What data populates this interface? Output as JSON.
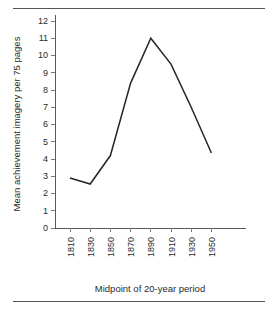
{
  "figure": {
    "top_rule": "",
    "bottom_rule": ""
  },
  "chart_data": {
    "type": "line",
    "title": "",
    "xlabel": "Midpoint of 20-year period",
    "ylabel": "Mean achievement imagery per 75 pages",
    "categories": [
      "1810",
      "1830",
      "1850",
      "1870",
      "1890",
      "1910",
      "1930",
      "1950"
    ],
    "x": [
      1810,
      1830,
      1850,
      1870,
      1890,
      1910,
      1930,
      1950
    ],
    "values": [
      2.9,
      2.55,
      4.2,
      8.4,
      11.0,
      9.5,
      7.0,
      4.35
    ],
    "series": [
      {
        "name": "Mean achievement imagery",
        "values": [
          2.9,
          2.55,
          4.2,
          8.4,
          11.0,
          9.5,
          7.0,
          4.35
        ]
      }
    ],
    "ylim": [
      0,
      12
    ],
    "xlim": [
      1800,
      1960
    ],
    "ytick_labels": [
      "0",
      "1",
      "2",
      "3",
      "4",
      "5",
      "6",
      "7",
      "8",
      "9",
      "10",
      "11",
      "12"
    ],
    "ytick_values": [
      0,
      1,
      2,
      3,
      4,
      5,
      6,
      7,
      8,
      9,
      10,
      11,
      12
    ],
    "xtick_labels": [
      "1810",
      "1830",
      "1850",
      "1870",
      "1890",
      "1910",
      "1930",
      "1950"
    ],
    "grid": false,
    "legend": false,
    "legend_position": "none",
    "line_color": "#262626",
    "axis_color": "#5a5a5a",
    "xtick_rotation": -90
  }
}
